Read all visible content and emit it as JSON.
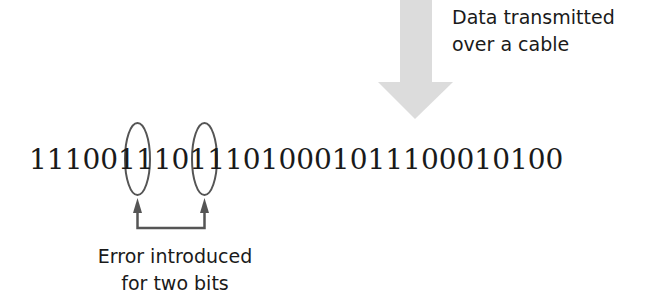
{
  "diagram": {
    "title_annotation": {
      "line1": "Data transmitted",
      "line2": "over a cable"
    },
    "bit_string": "111001110111010001011100010100",
    "error_annotation": {
      "line1": "Error introduced",
      "line2": "for two bits"
    },
    "highlighted_bit_positions": [
      7,
      11
    ],
    "colors": {
      "arrow_fill": "#dcdcdc",
      "annotation_stroke": "#555555",
      "text": "#1a1a1a"
    }
  }
}
